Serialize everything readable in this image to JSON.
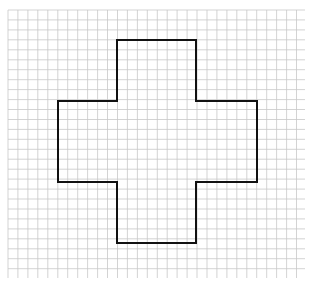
{
  "diagram": {
    "type": "grid-shape",
    "grid": {
      "x0": 8,
      "y0": 10,
      "x1": 305,
      "y1": 278,
      "spacing": 9.95,
      "line_color": "#c8c8c8",
      "line_width": 0.8
    },
    "shape": {
      "name": "cross",
      "stroke_color": "#111111",
      "stroke_width": 2,
      "points": [
        [
          117,
          40
        ],
        [
          196,
          40
        ],
        [
          196,
          101
        ],
        [
          257,
          101
        ],
        [
          257,
          182
        ],
        [
          196,
          182
        ],
        [
          196,
          243
        ],
        [
          117,
          243
        ],
        [
          117,
          182
        ],
        [
          58,
          182
        ],
        [
          58,
          101
        ],
        [
          117,
          101
        ]
      ]
    }
  }
}
